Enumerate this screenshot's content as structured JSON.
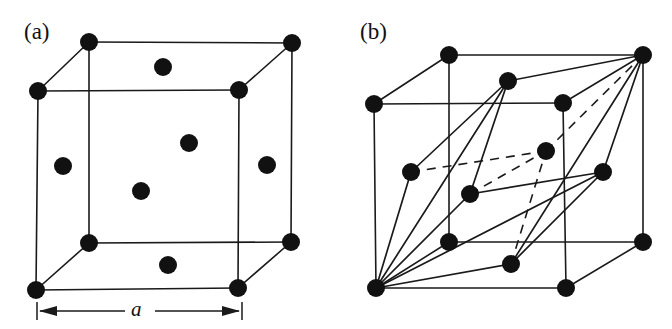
{
  "figure": {
    "kind": "crystal-structure-diagram",
    "background_color": "#ffffff",
    "line_color": "#1a1a1a",
    "atom_color": "#111111",
    "width": 672,
    "height": 329
  },
  "panels": [
    {
      "id": "a",
      "label": "(a)",
      "caption_text": "(a)",
      "description": "Face-centered cubic conventional unit cell with corner and face-center atoms",
      "dimension": {
        "label": "a",
        "label_text": "a",
        "name": "lattice-parameter",
        "line_y": 311,
        "x_start": 37,
        "x_end": 242
      },
      "cube": {
        "front_bottom_left": [
          36,
          290
        ],
        "front_bottom_right": [
          238,
          288
        ],
        "front_top_left": [
          38,
          91
        ],
        "front_top_right": [
          239,
          90
        ],
        "back_bottom_left": [
          89,
          243
        ],
        "back_bottom_right": [
          291,
          242
        ],
        "back_top_left": [
          89,
          42
        ],
        "back_top_right": [
          292,
          43
        ]
      },
      "atoms": [
        {
          "name": "corner-front-bottom-left",
          "x": 36,
          "y": 290,
          "r": 9
        },
        {
          "name": "corner-front-bottom-right",
          "x": 238,
          "y": 288,
          "r": 9
        },
        {
          "name": "corner-front-top-left",
          "x": 38,
          "y": 91,
          "r": 9
        },
        {
          "name": "corner-front-top-right",
          "x": 239,
          "y": 90,
          "r": 9
        },
        {
          "name": "corner-back-bottom-left",
          "x": 89,
          "y": 243,
          "r": 9
        },
        {
          "name": "corner-back-bottom-right",
          "x": 291,
          "y": 242,
          "r": 9
        },
        {
          "name": "corner-back-top-left",
          "x": 89,
          "y": 42,
          "r": 9
        },
        {
          "name": "corner-back-top-right",
          "x": 292,
          "y": 43,
          "r": 9
        },
        {
          "name": "face-center-top",
          "x": 163,
          "y": 67,
          "r": 9
        },
        {
          "name": "face-center-bottom",
          "x": 168,
          "y": 265,
          "r": 9
        },
        {
          "name": "face-center-left",
          "x": 63,
          "y": 166,
          "r": 9
        },
        {
          "name": "face-center-right",
          "x": 267,
          "y": 165,
          "r": 9
        },
        {
          "name": "face-center-front",
          "x": 141,
          "y": 191,
          "r": 9
        },
        {
          "name": "face-center-back",
          "x": 189,
          "y": 143,
          "r": 9
        }
      ],
      "atom_count": 14,
      "corner_atom_count": 8,
      "face_atom_count": 6
    },
    {
      "id": "b",
      "label": "(b)",
      "caption_text": "(b)",
      "description": "Primitive rhombohedral cell outlined inside the face-centered cubic cell",
      "cube": {
        "front_bottom_left": [
          376,
          288
        ],
        "front_bottom_right": [
          566,
          288
        ],
        "front_top_left": [
          374,
          104
        ],
        "front_top_right": [
          563,
          103
        ],
        "back_bottom_left": [
          449,
          242
        ],
        "back_bottom_right": [
          643,
          242
        ],
        "back_top_left": [
          449,
          55
        ],
        "back_top_right": [
          643,
          55
        ]
      },
      "atoms": [
        {
          "name": "corner-front-bottom-left",
          "x": 376,
          "y": 288,
          "r": 9
        },
        {
          "name": "corner-front-bottom-right",
          "x": 566,
          "y": 288,
          "r": 9
        },
        {
          "name": "corner-front-top-left",
          "x": 374,
          "y": 104,
          "r": 9
        },
        {
          "name": "corner-front-top-right",
          "x": 563,
          "y": 103,
          "r": 9
        },
        {
          "name": "corner-back-bottom-left",
          "x": 449,
          "y": 242,
          "r": 9
        },
        {
          "name": "corner-back-bottom-right",
          "x": 643,
          "y": 242,
          "r": 9
        },
        {
          "name": "corner-back-top-left",
          "x": 449,
          "y": 55,
          "r": 9
        },
        {
          "name": "corner-back-top-right",
          "x": 643,
          "y": 55,
          "r": 9
        },
        {
          "name": "face-center-top",
          "x": 508,
          "y": 81,
          "r": 9
        },
        {
          "name": "face-center-bottom",
          "x": 511,
          "y": 264,
          "r": 9
        },
        {
          "name": "face-center-left",
          "x": 411,
          "y": 172,
          "r": 9
        },
        {
          "name": "face-center-right",
          "x": 603,
          "y": 172,
          "r": 9
        },
        {
          "name": "face-center-front",
          "x": 470,
          "y": 194,
          "r": 9
        },
        {
          "name": "face-center-back",
          "x": 546,
          "y": 151,
          "r": 9
        }
      ],
      "atom_count": 14,
      "primitive_cell": {
        "origin": [
          376,
          288
        ],
        "far_corner": [
          643,
          55
        ],
        "solid_edges": [
          [
            [
              376,
              288
            ],
            [
              411,
              172
            ]
          ],
          [
            [
              376,
              288
            ],
            [
              470,
              194
            ]
          ],
          [
            [
              376,
              288
            ],
            [
              508,
              81
            ]
          ],
          [
            [
              376,
              288
            ],
            [
              511,
              264
            ]
          ],
          [
            [
              376,
              288
            ],
            [
              603,
              172
            ]
          ],
          [
            [
              411,
              172
            ],
            [
              508,
              81
            ]
          ],
          [
            [
              470,
              194
            ],
            [
              508,
              81
            ]
          ],
          [
            [
              470,
              194
            ],
            [
              603,
              172
            ]
          ],
          [
            [
              511,
              264
            ],
            [
              603,
              172
            ]
          ],
          [
            [
              508,
              81
            ],
            [
              643,
              55
            ]
          ],
          [
            [
              603,
              172
            ],
            [
              643,
              55
            ]
          ],
          [
            [
              511,
              264
            ],
            [
              643,
              55
            ]
          ]
        ],
        "dashed_edges": [
          [
            [
              411,
              172
            ],
            [
              546,
              151
            ]
          ],
          [
            [
              470,
              194
            ],
            [
              546,
              151
            ]
          ],
          [
            [
              546,
              151
            ],
            [
              643,
              55
            ]
          ],
          [
            [
              511,
              264
            ],
            [
              546,
              151
            ]
          ]
        ]
      }
    }
  ]
}
